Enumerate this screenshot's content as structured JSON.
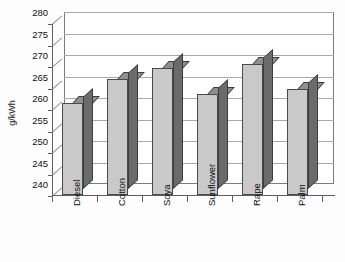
{
  "chart_data": {
    "type": "bar",
    "title": "",
    "subtitle": "",
    "xlabel": "",
    "ylabel": "g/kWh",
    "categories": [
      "Diesel",
      "Cotton",
      "Soya",
      "Sunflower",
      "Rape",
      "Palm"
    ],
    "values": [
      261.5,
      267.0,
      269.5,
      263.5,
      270.5,
      264.7
    ],
    "ylim": [
      240,
      280
    ],
    "ytick_values": [
      240,
      245,
      250,
      255,
      260,
      265,
      270,
      275,
      280
    ],
    "ytick_labels": [
      "240",
      "245",
      "250",
      "255",
      "260",
      "265",
      "270",
      "275",
      "280"
    ],
    "grid": true,
    "legend": false,
    "legend_position": "none",
    "series": [
      {
        "name": "Specific fuel consumption",
        "values": [
          261.5,
          267.0,
          269.5,
          263.5,
          270.5,
          264.7
        ]
      }
    ],
    "annotations": [],
    "style": {
      "three_d": true,
      "bar_face_color": "#c9c9c9",
      "bar_side_color": "#6b6b6b",
      "bar_top_color": "#8f8f8f",
      "bar_edge_color": "#3d3d3d",
      "gridline_color": "#a9a9a9",
      "axis_color": "#5e5e5e",
      "plot_background": "#ffffff",
      "figure_background": "#fdfdfd",
      "xtick_label_rotation": -90
    }
  }
}
